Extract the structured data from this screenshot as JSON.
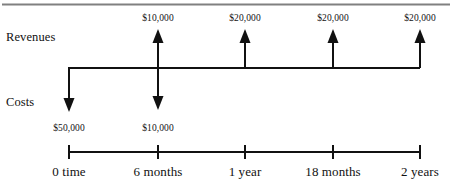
{
  "figure": {
    "title_rule": "top-divider",
    "row_labels": {
      "revenues": "Revenues",
      "costs": "Costs"
    },
    "axis": {
      "ticks": [
        {
          "label": "0 time",
          "x": 69
        },
        {
          "label": "6 months",
          "x": 158
        },
        {
          "label": "1 year",
          "x": 245
        },
        {
          "label": "18 months",
          "x": 333
        },
        {
          "label": "2 years",
          "x": 420
        }
      ]
    },
    "cash_inflows": [
      {
        "amount": "$10,000",
        "x": 158,
        "time": "6 months"
      },
      {
        "amount": "$20,000",
        "x": 245,
        "time": "1 year"
      },
      {
        "amount": "$20,000",
        "x": 333,
        "time": "18 months"
      },
      {
        "amount": "$20,000",
        "x": 420,
        "time": "2 years"
      }
    ],
    "cash_outflows": [
      {
        "amount": "$50,000",
        "x": 69,
        "time": "0 time"
      },
      {
        "amount": "$10,000",
        "x": 158,
        "time": "6 months"
      }
    ],
    "colors": {
      "ink": "#111111",
      "rule": "#808080",
      "background": "#ffffff"
    }
  }
}
